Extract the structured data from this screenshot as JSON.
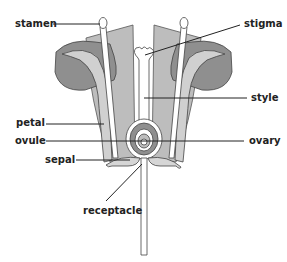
{
  "diagram": {
    "labels": {
      "stamen": "stamen",
      "stigma": "stigma",
      "style": "style",
      "petal": "petal",
      "ovule": "ovule",
      "ovary": "ovary",
      "sepal": "sepal",
      "receptacle": "receptacle"
    },
    "colors": {
      "petal_light": "#bdbdbd",
      "petal_dark": "#8f8f8f",
      "outline": "#444444",
      "inner_white": "#ffffff",
      "sepal": "#d6d6d6",
      "leader_line": "#222222"
    }
  }
}
